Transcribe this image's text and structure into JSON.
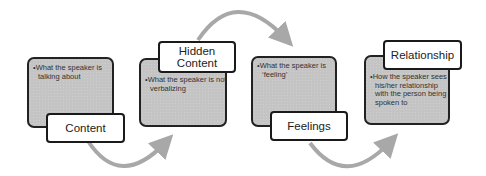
{
  "diagram": {
    "type": "process-flow",
    "colors": {
      "card_fill": "#c4c4c4",
      "card_border": "#222222",
      "label_fill": "#ffffff",
      "arrow": "#a8a8a8"
    },
    "steps": [
      {
        "title": "Content",
        "description": "What the speaker is talking about"
      },
      {
        "title": "Hidden Content",
        "description": "What the speaker is not verbalizing"
      },
      {
        "title": "Feelings",
        "description": "What the speaker is ‘feeling’"
      },
      {
        "title": "Relationship",
        "description": "How the speaker sees his/her relationship with the person being spoken to"
      }
    ],
    "bullet_marker": "•"
  }
}
